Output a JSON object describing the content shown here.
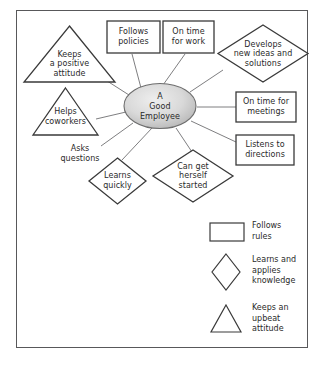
{
  "diagram": {
    "title_node": {
      "label": "A\nGood\nEmployee",
      "shape": "ellipse",
      "fill_light": "#e8e8e8",
      "fill_dark": "#b9b9b9",
      "stroke": "#6d6d6d"
    },
    "stroke_color": "#3a3a3a",
    "connector_color": "#6f6f72",
    "text_color": "#2a2a2a",
    "nodes": [
      {
        "id": "keeps-a-positive-attitude",
        "label": "Keeps\na positive\nattitude",
        "shape": "triangle"
      },
      {
        "id": "follows-policies",
        "label": "Follows\npolicies",
        "shape": "rectangle"
      },
      {
        "id": "on-time-for-work",
        "label": "On time\nfor work",
        "shape": "rectangle"
      },
      {
        "id": "develops-new-ideas-and-solutions",
        "label": "Develops\nnew ideas and\nsolutions",
        "shape": "diamond"
      },
      {
        "id": "on-time-for-meetings",
        "label": "On time for\nmeetings",
        "shape": "rectangle"
      },
      {
        "id": "listens-to-directions",
        "label": "Listens to\ndirections",
        "shape": "rectangle"
      },
      {
        "id": "can-get-herself-started",
        "label": "Can get\nherself\nstarted",
        "shape": "diamond"
      },
      {
        "id": "learns-quickly",
        "label": "Learns\nquickly",
        "shape": "diamond"
      },
      {
        "id": "asks-questions",
        "label": "Asks\nquestions",
        "shape": "none"
      },
      {
        "id": "helps-coworkers",
        "label": "Helps\ncoworkers",
        "shape": "triangle"
      }
    ]
  },
  "legend": {
    "items": [
      {
        "shape": "rectangle",
        "label": "Follows\nrules"
      },
      {
        "shape": "diamond",
        "label": "Learns and\napplies\nknowledge"
      },
      {
        "shape": "triangle",
        "label": "Keeps an\nupbeat\nattitude"
      }
    ]
  }
}
